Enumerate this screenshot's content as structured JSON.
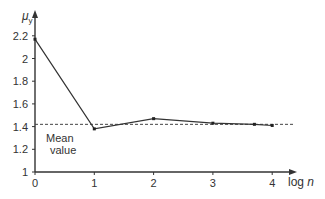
{
  "chart_data": {
    "type": "line",
    "title": "",
    "xlabel": "log n",
    "ylabel": "μy",
    "x_ticks": [
      "0",
      "1",
      "2",
      "3",
      "4"
    ],
    "y_ticks": [
      "1",
      "1.2",
      "1.4",
      "1.6",
      "1.8",
      "2",
      "2.2"
    ],
    "xlim": [
      0,
      4.4
    ],
    "ylim": [
      1,
      2.3
    ],
    "grid": false,
    "series": [
      {
        "name": "μy",
        "x": [
          0,
          1,
          2,
          3,
          3.7,
          4
        ],
        "y": [
          2.17,
          1.38,
          1.47,
          1.43,
          1.42,
          1.41
        ]
      }
    ],
    "reference_lines": [
      {
        "name": "Mean value",
        "y": 1.42,
        "style": "dashed"
      }
    ],
    "annotations": [
      {
        "text_line1": "Mean",
        "text_line2": "value"
      }
    ]
  },
  "labels": {
    "ylabel_main": "μ",
    "ylabel_sub": "y",
    "xlabel_prefix": "log ",
    "xlabel_var": "n",
    "mean_line1": "Mean",
    "mean_line2": "value"
  }
}
